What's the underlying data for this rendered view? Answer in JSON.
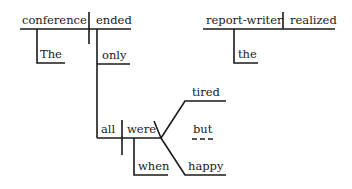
{
  "diagram": {
    "type": "sentence-diagram",
    "clause_1": {
      "subject": "conference",
      "verb": "ended",
      "subject_modifier": "The",
      "verb_modifier": "only",
      "subordinate_clause": {
        "subject": "all",
        "verb": "were",
        "adverb": "when",
        "complements": [
          "tired",
          "happy"
        ],
        "conjunction": "but"
      }
    },
    "clause_2": {
      "subject": "report-writer",
      "verb": "realized",
      "subject_modifier": "the"
    }
  },
  "colors": {
    "ink": "#1a1a1a",
    "background": "#ffffff"
  }
}
